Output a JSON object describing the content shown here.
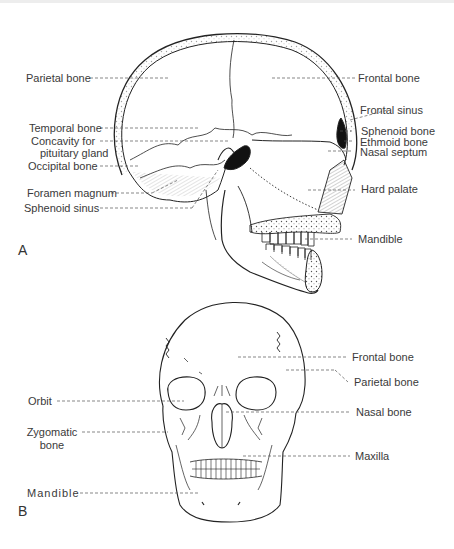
{
  "figure": {
    "panels": [
      {
        "id": "A",
        "view": "lateral sagittal section of skull",
        "letter": "A",
        "labels": {
          "parietal_bone": "Parietal bone",
          "temporal_bone": "Temporal bone",
          "concavity_line1": "Concavity for",
          "concavity_line2": "pituitary gland",
          "occipital_bone": "Occipital bone",
          "foramen_magnum": "Foramen magnum",
          "sphenoid_sinus": "Sphenoid sinus",
          "frontal_bone": "Frontal bone",
          "frontal_sinus": "Frontal sinus",
          "sphenoid_bone": "Sphenoid bone",
          "ethmoid_bone": "Ethmoid bone",
          "nasal_septum": "Nasal septum",
          "hard_palate": "Hard palate",
          "mandible": "Mandible"
        }
      },
      {
        "id": "B",
        "view": "anterior view of skull",
        "letter": "B",
        "labels": {
          "orbit": "Orbit",
          "zygomatic_line1": "Zygomatic",
          "zygomatic_line2": "bone",
          "mandible": "Mandible",
          "frontal_bone": "Frontal bone",
          "parietal_bone": "Parietal bone",
          "nasal_bone": "Nasal bone",
          "maxilla": "Maxilla"
        }
      }
    ]
  }
}
